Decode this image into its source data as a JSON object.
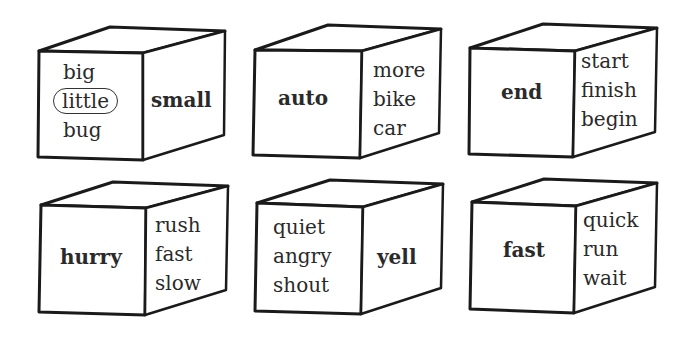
{
  "cubes": [
    {
      "key_word": "small",
      "key_face": "side",
      "choices": [
        "big",
        "little",
        "bug"
      ],
      "circled": "little"
    },
    {
      "key_word": "auto",
      "key_face": "front",
      "choices": [
        "more",
        "bike",
        "car"
      ],
      "circled": null
    },
    {
      "key_word": "end",
      "key_face": "front",
      "choices": [
        "start",
        "finish",
        "begin"
      ],
      "circled": null
    },
    {
      "key_word": "hurry",
      "key_face": "front",
      "choices": [
        "rush",
        "fast",
        "slow"
      ],
      "circled": null
    },
    {
      "key_word": "yell",
      "key_face": "side",
      "choices": [
        "quiet",
        "angry",
        "shout"
      ],
      "circled": null
    },
    {
      "key_word": "fast",
      "key_face": "front",
      "choices": [
        "quick",
        "run",
        "wait"
      ],
      "circled": null
    }
  ]
}
